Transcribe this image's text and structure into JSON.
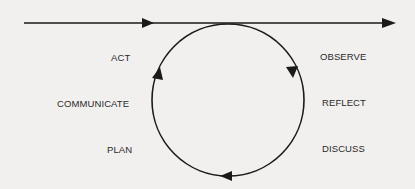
{
  "diagram": {
    "type": "cycle",
    "timeline_direction": "left-to-right",
    "cycle_direction": "clockwise",
    "colors": {
      "background": "#f1f0ee",
      "stroke": "#1a1a1a",
      "text": "#2a2a2a"
    },
    "labels_left": [
      {
        "id": "act",
        "text": "ACT"
      },
      {
        "id": "communicate",
        "text": "COMMUNICATE"
      },
      {
        "id": "plan",
        "text": "PLAN"
      }
    ],
    "labels_right": [
      {
        "id": "observe",
        "text": "OBSERVE"
      },
      {
        "id": "reflect",
        "text": "REFLECT"
      },
      {
        "id": "discuss",
        "text": "DISCUSS"
      }
    ]
  }
}
